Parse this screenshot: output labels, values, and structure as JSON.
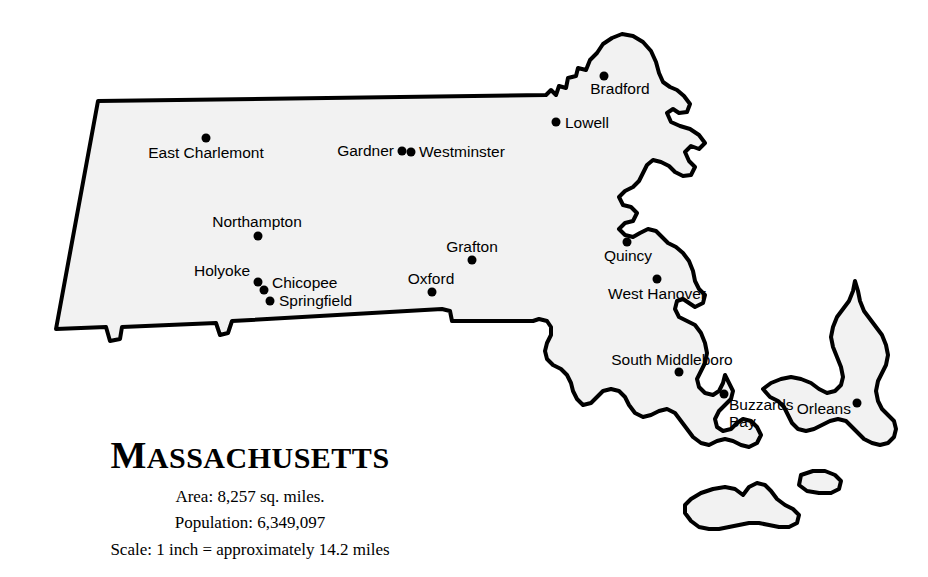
{
  "title": {
    "first_letter": "M",
    "rest": "ASSACHUSETTS",
    "full": "MASSACHUSETTS"
  },
  "caption": {
    "area": "Area: 8,257 sq. miles.",
    "population": "Population: 6,349,097",
    "scale": "Scale: 1 inch = approximately 14.2 miles"
  },
  "colors": {
    "land_fill": "#f2f2f2",
    "outline": "#000000",
    "text": "#000000",
    "background": "#ffffff"
  },
  "cities": [
    {
      "name": "East Charlemont",
      "dot_x": 206,
      "dot_y": 138,
      "label_x": 206,
      "label_y": 153,
      "anchor": "mid"
    },
    {
      "name": "Gardner",
      "dot_x": 402,
      "dot_y": 151,
      "label_x": 394,
      "label_y": 151,
      "anchor": "end"
    },
    {
      "name": "Westminster",
      "dot_x": 411,
      "dot_y": 152,
      "label_x": 419,
      "label_y": 152,
      "anchor": "start"
    },
    {
      "name": "Bradford",
      "dot_x": 604,
      "dot_y": 76,
      "label_x": 620,
      "label_y": 89,
      "anchor": "mid"
    },
    {
      "name": "Lowell",
      "dot_x": 556,
      "dot_y": 122,
      "label_x": 565,
      "label_y": 123,
      "anchor": "start"
    },
    {
      "name": "Northampton",
      "dot_x": 258,
      "dot_y": 236,
      "label_x": 257,
      "label_y": 222,
      "anchor": "mid"
    },
    {
      "name": "Holyoke",
      "dot_x": 258,
      "dot_y": 282,
      "label_x": 250,
      "label_y": 271,
      "anchor": "end"
    },
    {
      "name": "Chicopee",
      "dot_x": 264,
      "dot_y": 290,
      "label_x": 272,
      "label_y": 283,
      "anchor": "start"
    },
    {
      "name": "Springfield",
      "dot_x": 270,
      "dot_y": 301,
      "label_x": 279,
      "label_y": 301,
      "anchor": "start"
    },
    {
      "name": "Grafton",
      "dot_x": 472,
      "dot_y": 260,
      "label_x": 472,
      "label_y": 247,
      "anchor": "mid"
    },
    {
      "name": "Oxford",
      "dot_x": 432,
      "dot_y": 292,
      "label_x": 431,
      "label_y": 279,
      "anchor": "mid"
    },
    {
      "name": "Quincy",
      "dot_x": 627,
      "dot_y": 242,
      "label_x": 628,
      "label_y": 256,
      "anchor": "mid"
    },
    {
      "name": "West Hanover",
      "dot_x": 657,
      "dot_y": 279,
      "label_x": 657,
      "label_y": 294,
      "anchor": "mid"
    },
    {
      "name": "South Middleboro",
      "dot_x": 679,
      "dot_y": 372,
      "label_x": 672,
      "label_y": 360,
      "anchor": "mid"
    },
    {
      "name": "Buzzards\nBay",
      "dot_x": 724,
      "dot_y": 394,
      "label_x": 729,
      "label_y": 413,
      "anchor": "start"
    },
    {
      "name": "Orleans",
      "dot_x": 857,
      "dot_y": 403,
      "label_x": 851,
      "label_y": 409,
      "anchor": "end"
    }
  ],
  "map": {
    "name": "massachusetts-outline",
    "mainland_path": "M 98 102 L 545 96 L 550 92 L 556 96 L 560 88 L 566 90 L 568 80 L 575 78 L 577 70 L 584 72 L 588 62 L 596 56 L 600 46 L 608 40 L 618 36 L 628 34 L 640 38 L 650 46 L 656 56 L 660 68 L 664 78 L 670 84 L 678 88 L 684 96 L 690 104 L 688 112 L 680 114 L 674 110 L 668 114 L 672 122 L 680 126 L 690 128 L 700 134 L 706 142 L 700 148 L 692 146 L 686 152 L 690 160 L 696 166 L 692 174 L 684 176 L 676 172 L 670 166 L 662 162 L 654 160 L 648 164 L 644 172 L 640 180 L 634 186 L 626 190 L 620 196 L 624 204 L 632 206 L 638 212 L 634 220 L 626 222 L 620 228 L 626 234 L 634 236 L 640 232 L 648 228 L 656 230 L 662 236 L 668 242 L 676 246 L 684 252 L 690 260 L 694 270 L 696 280 L 700 288 L 706 294 L 704 302 L 696 306 L 690 302 L 684 298 L 678 300 L 676 308 L 680 316 L 688 320 L 696 324 L 702 332 L 706 342 L 708 352 L 706 362 L 702 370 L 698 378 L 700 386 L 706 392 L 714 394 L 720 390 L 724 382 L 726 374 L 730 382 L 734 390 L 732 398 L 726 404 L 720 410 L 716 418 L 718 426 L 724 430 L 732 428 L 738 422 L 744 418 L 752 420 L 758 426 L 762 434 L 758 442 L 750 446 L 742 444 L 734 440 L 726 438 L 718 440 L 710 444 L 702 442 L 694 436 L 688 428 L 682 420 L 676 412 L 668 408 L 660 410 L 652 414 L 644 416 L 636 412 L 630 404 L 626 396 L 620 390 L 612 388 L 604 390 L 598 396 L 592 402 L 584 404 L 578 398 L 574 390 L 572 382 L 568 374 L 562 368 L 554 364 L 548 358 L 546 350 L 548 342 L 552 334 L 552 326 L 548 320 L 540 318 L 534 320 L 450 320 L 448 310 L 440 308 L 230 320 L 226 332 L 218 334 L 214 322 L 120 326 L 118 338 L 108 340 L 104 326 L 55 328 Z",
    "mainland_simple_note": "irregular coastal outline",
    "cape_cod_path": "M 762 388 L 770 382 L 780 378 L 790 376 L 800 378 L 810 382 L 818 388 L 826 392 L 834 390 L 840 384 L 842 376 L 840 366 L 836 356 L 832 346 L 830 336 L 832 326 L 836 316 L 842 308 L 848 300 L 852 290 L 854 280 L 856 290 L 858 300 L 862 310 L 868 318 L 874 326 L 880 334 L 884 344 L 886 354 L 884 364 L 880 372 L 876 380 L 874 390 L 876 400 L 880 408 L 886 414 L 892 420 L 894 428 L 892 436 L 886 442 L 878 444 L 870 442 L 862 438 L 856 432 L 850 426 L 844 420 L 836 418 L 828 420 L 820 424 L 812 428 L 804 430 L 796 428 L 790 422 L 786 414 L 782 406 L 776 400 L 768 396 Z",
    "island_mv_path": "M 690 498 L 700 492 L 712 488 L 724 486 L 734 488 L 742 494 L 748 486 L 756 482 L 764 484 L 770 490 L 776 498 L 784 504 L 792 508 L 798 514 L 796 522 L 788 526 L 778 526 L 768 524 L 758 522 L 748 522 L 738 524 L 728 526 L 718 528 L 708 528 L 698 526 L 690 520 L 684 512 L 684 504 Z",
    "island_nantucket_path": "M 800 474 L 812 470 L 824 470 L 834 474 L 840 480 L 838 488 L 830 492 L 818 492 L 806 490 L 798 484 Z"
  }
}
